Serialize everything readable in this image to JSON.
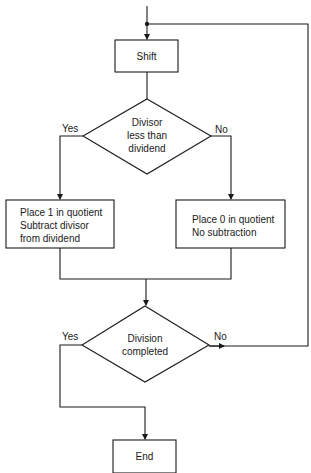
{
  "diagram": {
    "type": "flowchart",
    "nodes": {
      "shift": {
        "label": "Shift",
        "shape": "rectangle"
      },
      "decision1": {
        "line1": "Divisor",
        "line2": "less than",
        "line3": "dividend",
        "shape": "diamond"
      },
      "place1": {
        "line1": "Place 1 in quotient",
        "line2": "Subtract divisor",
        "line3": "from dividend",
        "shape": "rectangle"
      },
      "place0": {
        "line1": "Place 0 in quotient",
        "line2": "No subtraction",
        "shape": "rectangle"
      },
      "decision2": {
        "line1": "Division",
        "line2": "completed",
        "shape": "diamond"
      },
      "end": {
        "label": "End",
        "shape": "rectangle"
      }
    },
    "edge_labels": {
      "d1_yes": "Yes",
      "d1_no": "No",
      "d2_yes": "Yes",
      "d2_no": "No"
    },
    "edges": [
      {
        "from": "start",
        "to": "shift"
      },
      {
        "from": "shift",
        "to": "decision1"
      },
      {
        "from": "decision1",
        "to": "place1",
        "label": "Yes"
      },
      {
        "from": "decision1",
        "to": "place0",
        "label": "No"
      },
      {
        "from": "place1",
        "to": "decision2"
      },
      {
        "from": "place0",
        "to": "decision2"
      },
      {
        "from": "decision2",
        "to": "end",
        "label": "Yes"
      },
      {
        "from": "decision2",
        "to": "shift",
        "label": "No"
      }
    ],
    "line_color": "#1a1a1a"
  }
}
